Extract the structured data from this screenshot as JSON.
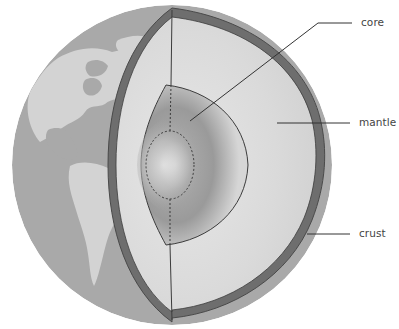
{
  "diagram": {
    "labels": [
      {
        "id": "core",
        "text": "core"
      },
      {
        "id": "mantle",
        "text": "mantle"
      },
      {
        "id": "crust",
        "text": "crust"
      }
    ],
    "colors": {
      "ocean": "#a9a9a9",
      "land": "#d3d3d3",
      "crust": "#6e6e6e",
      "crust_edge": "#4a4a4a",
      "mantle": "#d9d9d9",
      "core_dark": "#8c8c8c",
      "outline": "#3c3c3c",
      "leader": "#333333",
      "label_text": "#444444"
    }
  }
}
